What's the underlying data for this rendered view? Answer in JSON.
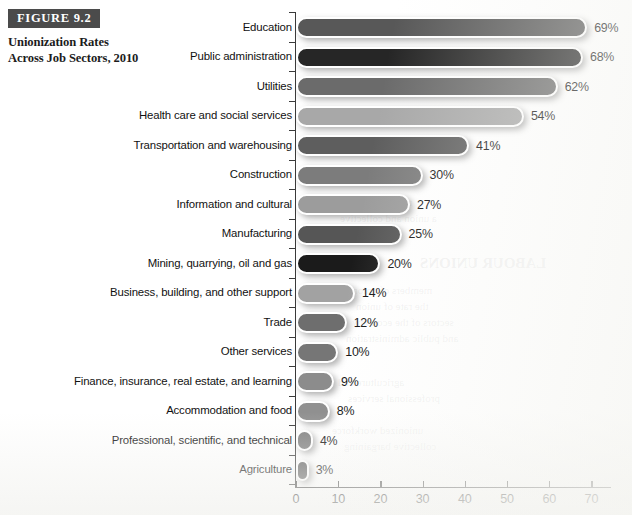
{
  "figure": {
    "number_label": "FIGURE 9.2",
    "title": "Unionization Rates Across Job Sectors, 2010"
  },
  "bleed_through": [
    {
      "text": "LABOUR UNIONS",
      "x": 420,
      "y": 255,
      "size": 15,
      "weight": "bold"
    },
    {
      "text": "the workers in that",
      "x": 330,
      "y": 196,
      "size": 11,
      "weight": "normal"
    },
    {
      "text": "a union and collective",
      "x": 340,
      "y": 212,
      "size": 11,
      "weight": "normal"
    },
    {
      "text": "members of unions",
      "x": 348,
      "y": 284,
      "size": 11,
      "weight": "normal"
    },
    {
      "text": "the rate of union",
      "x": 356,
      "y": 300,
      "size": 11,
      "weight": "normal"
    },
    {
      "text": "sectors of the economy",
      "x": 352,
      "y": 316,
      "size": 11,
      "weight": "normal"
    },
    {
      "text": "and public administration",
      "x": 346,
      "y": 332,
      "size": 11,
      "weight": "normal"
    },
    {
      "text": "agriculture and",
      "x": 338,
      "y": 376,
      "size": 11,
      "weight": "normal"
    },
    {
      "text": "professional services",
      "x": 348,
      "y": 392,
      "size": 11,
      "weight": "normal"
    },
    {
      "text": "unionized workforce",
      "x": 332,
      "y": 424,
      "size": 11,
      "weight": "normal"
    },
    {
      "text": "collective bargaining",
      "x": 344,
      "y": 440,
      "size": 11,
      "weight": "normal"
    }
  ],
  "chart_data": {
    "type": "bar",
    "orientation": "horizontal",
    "title": "Unionization Rates Across Job Sectors, 2010",
    "xlabel": "",
    "ylabel": "",
    "xlim": [
      0,
      75
    ],
    "grid": false,
    "legend": false,
    "value_suffix": "%",
    "x_ticks": [
      0,
      10,
      20,
      30,
      40,
      50,
      60,
      70
    ],
    "x_tick_labels": [
      "0",
      "10",
      "20",
      "30",
      "40",
      "50",
      "60",
      "70"
    ],
    "categories": [
      "Education",
      "Public administration",
      "Utilities",
      "Health care and social services",
      "Transportation and warehousing",
      "Construction",
      "Information and cultural",
      "Manufacturing",
      "Mining, quarrying, oil and gas",
      "Business, building, and other support",
      "Trade",
      "Other services",
      "Finance, insurance, real estate, and learning",
      "Accommodation and food",
      "Professional, scientific, and technical",
      "Agriculture"
    ],
    "values": [
      69,
      68,
      62,
      54,
      41,
      30,
      27,
      25,
      20,
      14,
      12,
      10,
      9,
      8,
      4,
      3
    ],
    "value_labels": [
      "69%",
      "68%",
      "62%",
      "54%",
      "41%",
      "30%",
      "27%",
      "25%",
      "20%",
      "14%",
      "12%",
      "10%",
      "9%",
      "8%",
      "4%",
      "3%"
    ],
    "bar_colors": [
      "#585858",
      "#262626",
      "#6b6b6b",
      "#a8a8a8",
      "#5e5e5e",
      "#7c7c7c",
      "#9c9c9c",
      "#565656",
      "#1b1b1b",
      "#a2a2a2",
      "#6e6e6e",
      "#767676",
      "#8c8c8c",
      "#909090",
      "#808080",
      "#626262"
    ]
  },
  "colors": {
    "badge_background": "#4b4b4b",
    "badge_text": "#ffffff",
    "axis": "#3a3a3a",
    "page_background": "#ffffff",
    "text": "#1a1a1a"
  }
}
